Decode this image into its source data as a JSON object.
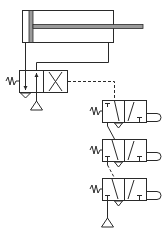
{
  "diagram": {
    "type": "pneumatic-circuit",
    "description": "Double-acting cylinder controlled by a spring-return 4/2 valve, piloted through three series roller-operated 3/2 valves",
    "components": [
      {
        "id": "cylinder",
        "label": "Double-acting cylinder"
      },
      {
        "id": "main-valve",
        "label": "4/2 directional valve, spring return"
      },
      {
        "id": "pilot-valve-1",
        "label": "3/2 valve, roller operated, spring return"
      },
      {
        "id": "pilot-valve-2",
        "label": "3/2 valve, roller operated, spring return"
      },
      {
        "id": "pilot-valve-3",
        "label": "3/2 valve, roller operated, spring return"
      },
      {
        "id": "supply-main",
        "label": "Pressure source"
      },
      {
        "id": "supply-pilot",
        "label": "Pressure source"
      }
    ],
    "colors": {
      "line": "#2a2a2a",
      "rod": "#9a9a9a",
      "background": "#ffffff"
    }
  }
}
